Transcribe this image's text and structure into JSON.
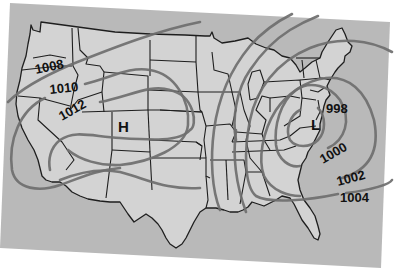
{
  "map": {
    "title": "",
    "region": "Contiguous United States",
    "type": "surface pressure / isobar map",
    "colors": {
      "background": "#ffffff",
      "ocean": "#b9b9b9",
      "land": "#d3d3d3",
      "state_border": "#1e1e1e",
      "isobar": "#6e6e6e",
      "label": "#111111"
    },
    "pressure_centers": [
      {
        "id": "high",
        "label": "H",
        "meaning": "high pressure",
        "location": "Colorado"
      },
      {
        "id": "low",
        "label": "L",
        "meaning": "low pressure",
        "location": "Virginia / Mid-Atlantic"
      }
    ],
    "isobars": [
      {
        "value": "998",
        "label": "998"
      },
      {
        "value": "1000",
        "label": "1000"
      },
      {
        "value": "1002",
        "label": "1002"
      },
      {
        "value": "1004",
        "label": "1004"
      },
      {
        "value": "1008",
        "label": "1008"
      },
      {
        "value": "1010",
        "label": "1010"
      },
      {
        "value": "1012",
        "label": "1012"
      }
    ],
    "units": "millibars"
  }
}
